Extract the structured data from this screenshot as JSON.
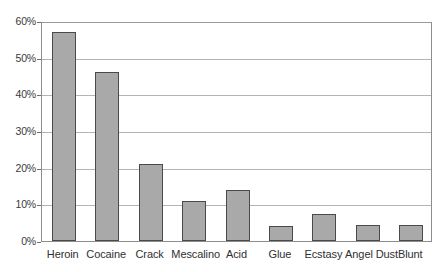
{
  "chart_data": {
    "type": "bar",
    "title": "",
    "subtitle": "",
    "xlabel": "",
    "ylabel": "",
    "categories": [
      "Heroin",
      "Cocaine",
      "Crack",
      "Mescalino",
      "Acid",
      "Glue",
      "Ecstasy",
      "Angel Dust",
      "Blunt"
    ],
    "values": [
      57,
      46,
      21,
      11,
      14,
      4,
      7.5,
      4.5,
      4.5
    ],
    "value_suffix": "%",
    "ylim": [
      0,
      60
    ],
    "ytick_values": [
      0,
      10,
      20,
      30,
      40,
      50,
      60
    ],
    "ytick_labels": [
      "0%",
      "10%",
      "20%",
      "30%",
      "40%",
      "50%",
      "60%"
    ],
    "grid": true,
    "grid_axis": "y",
    "legend": false,
    "legend_position": "none",
    "bar_color": "#a9a9a9",
    "bar_border_color": "#4a4a4a",
    "gridline_color": "#b4b4b4",
    "axis_color": "#8d8d8d",
    "plot_background": "#ffffff",
    "figure_background": "#ffffff",
    "annotations": []
  }
}
